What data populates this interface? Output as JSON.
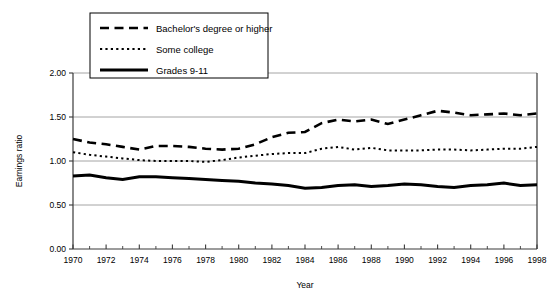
{
  "chart_data": {
    "type": "line",
    "title": "",
    "xlabel": "Year",
    "ylabel": "Earnings ratio",
    "xlim": [
      1970,
      1998
    ],
    "ylim": [
      0.0,
      2.0
    ],
    "ytick_labels": [
      "0.00",
      "0.50",
      "1.00",
      "1.50",
      "2.00"
    ],
    "ytick_values": [
      0.0,
      0.5,
      1.0,
      1.5,
      2.0
    ],
    "xtick_labels": [
      "1970",
      "1972",
      "1974",
      "1976",
      "1978",
      "1980",
      "1982",
      "1984",
      "1986",
      "1988",
      "1990",
      "1992",
      "1994",
      "1996",
      "1998"
    ],
    "xtick_values": [
      1970,
      1972,
      1974,
      1976,
      1978,
      1980,
      1982,
      1984,
      1986,
      1988,
      1990,
      1992,
      1994,
      1996,
      1998
    ],
    "minor_xticks": [
      1971,
      1973,
      1975,
      1977,
      1979,
      1981,
      1983,
      1985,
      1987,
      1989,
      1991,
      1993,
      1995,
      1997
    ],
    "grid": "horizontal",
    "legend_position": "top-left",
    "x": [
      1970,
      1971,
      1972,
      1973,
      1974,
      1975,
      1976,
      1977,
      1978,
      1979,
      1980,
      1981,
      1982,
      1983,
      1984,
      1985,
      1986,
      1987,
      1988,
      1989,
      1990,
      1991,
      1992,
      1993,
      1994,
      1995,
      1996,
      1997,
      1998
    ],
    "series": [
      {
        "name": "Bachelor's degree or higher",
        "style": "dashed",
        "values": [
          1.25,
          1.21,
          1.19,
          1.16,
          1.13,
          1.17,
          1.17,
          1.16,
          1.14,
          1.13,
          1.14,
          1.19,
          1.27,
          1.32,
          1.33,
          1.43,
          1.47,
          1.45,
          1.47,
          1.42,
          1.47,
          1.52,
          1.57,
          1.55,
          1.52,
          1.53,
          1.54,
          1.52,
          1.54
        ]
      },
      {
        "name": "Some college",
        "style": "dotted",
        "values": [
          1.1,
          1.07,
          1.05,
          1.03,
          1.01,
          1.0,
          1.0,
          1.0,
          0.99,
          1.01,
          1.04,
          1.06,
          1.08,
          1.09,
          1.09,
          1.14,
          1.16,
          1.13,
          1.15,
          1.12,
          1.12,
          1.12,
          1.13,
          1.13,
          1.12,
          1.13,
          1.14,
          1.14,
          1.16
        ]
      },
      {
        "name": "Grades 9-11",
        "style": "solid",
        "values": [
          0.83,
          0.84,
          0.81,
          0.79,
          0.82,
          0.82,
          0.81,
          0.8,
          0.79,
          0.78,
          0.77,
          0.75,
          0.74,
          0.72,
          0.69,
          0.7,
          0.72,
          0.73,
          0.71,
          0.72,
          0.74,
          0.73,
          0.71,
          0.7,
          0.72,
          0.73,
          0.75,
          0.72,
          0.73
        ]
      }
    ]
  },
  "legend": {
    "items": [
      {
        "label": "Bachelor's degree or higher"
      },
      {
        "label": "Some college"
      },
      {
        "label": "Grades 9-11"
      }
    ]
  },
  "colors": {
    "series": "#000000",
    "grid": "#9a9a9a",
    "axis": "#3a3a3a",
    "background": "#ffffff"
  }
}
